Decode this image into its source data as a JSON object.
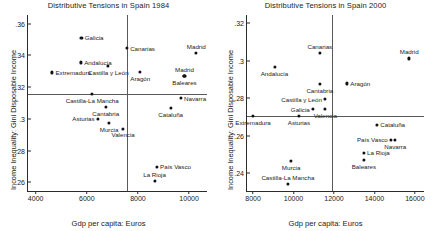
{
  "figure": {
    "xlabel": "Gdp per capita: Euros",
    "ylabel": "Income Inequality: Gini Disposable Income"
  },
  "chart_data": [
    {
      "type": "scatter",
      "title": "Distributive Tensions in Spain 1984",
      "xlabel": "Gdp per capita: Euros",
      "ylabel": "Income Inequality: Gini Disposable Income",
      "xlim": [
        3700,
        10700
      ],
      "ylim": [
        0.2545,
        0.3655
      ],
      "xticks": [
        4000,
        6000,
        8000,
        10000
      ],
      "yticks": [
        0.26,
        0.28,
        0.3,
        0.32,
        0.34,
        0.36
      ],
      "ytick_labels": [
        ".26",
        ".28",
        ".3",
        ".32",
        ".34",
        ".36"
      ],
      "xtick_labels": [
        "4000",
        "6000",
        "8000",
        "10000"
      ],
      "grid": false,
      "legend": "none",
      "reference_lines": {
        "horizontal_y": 0.3155,
        "vertical_x": 7570
      },
      "points": [
        {
          "label": "Galicia",
          "x": 5790,
          "y": 0.3513,
          "label_pos": "right"
        },
        {
          "label": "Canarias",
          "x": 7570,
          "y": 0.3445,
          "label_pos": "right"
        },
        {
          "label": "Madrid",
          "x": 10280,
          "y": 0.3418,
          "label_pos": "above"
        },
        {
          "label": "Andalucía",
          "x": 5770,
          "y": 0.3356,
          "label_pos": "right"
        },
        {
          "label": "Castilla y León",
          "x": 6840,
          "y": 0.3333,
          "label_pos": "below"
        },
        {
          "label": "Extremadura",
          "x": 4650,
          "y": 0.3293,
          "label_pos": "right"
        },
        {
          "label": "Aragón",
          "x": 8090,
          "y": 0.3296,
          "label_pos": "below"
        },
        {
          "label": "Baleares",
          "x": 9820,
          "y": 0.327,
          "label_pos": "below"
        },
        {
          "label": "Madrid",
          "x": 9820,
          "y": 0.327,
          "label_pos": "above"
        },
        {
          "label": "Castilla-La Mancha",
          "x": 6210,
          "y": 0.3155,
          "label_pos": "below"
        },
        {
          "label": "Navarra",
          "x": 9680,
          "y": 0.313,
          "label_pos": "right"
        },
        {
          "label": "Cataluña",
          "x": 9280,
          "y": 0.3068,
          "label_pos": "below"
        },
        {
          "label": "Cantabria",
          "x": 6740,
          "y": 0.3073,
          "label_pos": "below"
        },
        {
          "label": "Asturias",
          "x": 6430,
          "y": 0.3,
          "label_pos": "left"
        },
        {
          "label": "Murcia",
          "x": 6870,
          "y": 0.2975,
          "label_pos": "below"
        },
        {
          "label": "Valencia",
          "x": 7420,
          "y": 0.2938,
          "label_pos": "below"
        },
        {
          "label": "País Vasco",
          "x": 8740,
          "y": 0.2697,
          "label_pos": "right"
        },
        {
          "label": "La Rioja",
          "x": 8650,
          "y": 0.261,
          "label_pos": "above"
        }
      ]
    },
    {
      "type": "scatter",
      "title": "Distributive Tensions in Spain 2000",
      "xlabel": "Gdp per capita: Euros",
      "ylabel": "Income Inequality: Gini Disposable Income",
      "xlim": [
        7700,
        16450
      ],
      "ylim": [
        0.2305,
        0.3245
      ],
      "xticks": [
        8000,
        10000,
        12000,
        14000,
        16000
      ],
      "yticks": [
        0.24,
        0.26,
        0.28,
        0.3,
        0.32
      ],
      "ytick_labels": [
        ".24",
        ".26",
        ".28",
        ".3",
        ".32"
      ],
      "xtick_labels": [
        "8000",
        "10000",
        "12000",
        "14000",
        "16000"
      ],
      "grid": false,
      "legend": "none",
      "reference_lines": {
        "horizontal_y": 0.2705,
        "vertical_x": 11920
      },
      "points": [
        {
          "label": "Canarias",
          "x": 11300,
          "y": 0.3043,
          "label_pos": "above"
        },
        {
          "label": "Madrid",
          "x": 15720,
          "y": 0.3013,
          "label_pos": "above"
        },
        {
          "label": "Andalucía",
          "x": 9060,
          "y": 0.2967,
          "label_pos": "below"
        },
        {
          "label": "Cantabria",
          "x": 11300,
          "y": 0.2877,
          "label_pos": "below"
        },
        {
          "label": "Aragón",
          "x": 12650,
          "y": 0.288,
          "label_pos": "right"
        },
        {
          "label": "Castilla y León",
          "x": 11560,
          "y": 0.2795,
          "label_pos": "left"
        },
        {
          "label": "Valencia",
          "x": 11570,
          "y": 0.2742,
          "label_pos": "below"
        },
        {
          "label": "Galicia",
          "x": 10960,
          "y": 0.2742,
          "label_pos": "left"
        },
        {
          "label": "Extremadura",
          "x": 8000,
          "y": 0.2705,
          "label_pos": "below"
        },
        {
          "label": "Asturias",
          "x": 10270,
          "y": 0.2705,
          "label_pos": "below"
        },
        {
          "label": "Cataluña",
          "x": 14130,
          "y": 0.266,
          "label_pos": "right"
        },
        {
          "label": "País Vasco",
          "x": 14820,
          "y": 0.2578,
          "label_pos": "left"
        },
        {
          "label": "Navarra",
          "x": 15030,
          "y": 0.2576,
          "label_pos": "below"
        },
        {
          "label": "La Rioja",
          "x": 13480,
          "y": 0.251,
          "label_pos": "right"
        },
        {
          "label": "Baleares",
          "x": 13480,
          "y": 0.2472,
          "label_pos": "below"
        },
        {
          "label": "Murcia",
          "x": 9880,
          "y": 0.2465,
          "label_pos": "below"
        },
        {
          "label": "Castilla-La Mancha",
          "x": 9720,
          "y": 0.2345,
          "label_pos": "above"
        }
      ]
    }
  ]
}
